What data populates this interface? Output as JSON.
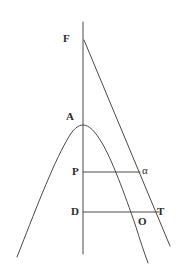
{
  "figure": {
    "domain": "Diagram",
    "background_color": "#ffffff",
    "stroke_color": "#4a4a4a",
    "label_color": "#2b2b2b",
    "width": 177,
    "height": 279,
    "labels": {
      "focus": "F",
      "apex": "A",
      "ordinate_point": "P",
      "base_point": "D",
      "origin_point": "O",
      "tangent_point": "T",
      "angle": "α"
    },
    "label_positions": {
      "focus": {
        "x": 63,
        "y": 33
      },
      "apex": {
        "x": 66,
        "y": 111
      },
      "ordinate_point": {
        "x": 72,
        "y": 166
      },
      "base_point": {
        "x": 71,
        "y": 206
      },
      "origin_point": {
        "x": 138,
        "y": 216
      },
      "tangent_point": {
        "x": 157,
        "y": 206
      },
      "angle": {
        "x": 142,
        "y": 165
      }
    },
    "geometry": {
      "axis_line": {
        "x": 83,
        "y_top": 22,
        "y_bottom": 254
      },
      "parabola": {
        "vertex": {
          "x": 83,
          "y": 125
        },
        "left_end": {
          "x": 17,
          "y": 257
        },
        "right_end": {
          "x": 148,
          "y": 263
        },
        "description": "downward-opening parabola, axis vertical through A"
      },
      "tangent_line": {
        "start": {
          "x": 84,
          "y": 40
        },
        "end": {
          "x": 170,
          "y": 246
        },
        "touches_parabola_at": {
          "x": 138,
          "y": 172
        }
      },
      "ordinate_segment": {
        "x1": 83,
        "y1": 172,
        "x2": 140,
        "y2": 172
      },
      "base_segment": {
        "x1": 83,
        "y1": 212,
        "x2": 159,
        "y2": 212
      }
    }
  }
}
